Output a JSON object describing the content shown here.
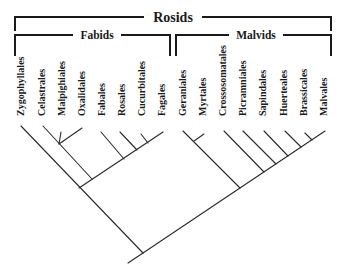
{
  "diagram": {
    "type": "phylogenetic-cladogram",
    "title": "Rosids",
    "clades": [
      {
        "name": "Fabids",
        "orders": [
          "Zygophyllales",
          "Celastrales",
          "Malpighiales",
          "Oxalidales",
          "Fabales",
          "Rosales",
          "Cucurbitales",
          "Fagales"
        ]
      },
      {
        "name": "Malvids",
        "orders": [
          "Geraniales",
          "Myrtales",
          "Crossosomatales",
          "Picramniales",
          "Sapindales",
          "Huerteales",
          "Brassicales",
          "Malvales"
        ]
      }
    ],
    "tips": [
      {
        "label": "Zygophyllales",
        "x": 20
      },
      {
        "label": "Celastrales",
        "x": 41
      },
      {
        "label": "Malpighiales",
        "x": 61
      },
      {
        "label": "Oxalidales",
        "x": 81
      },
      {
        "label": "Fabales",
        "x": 101
      },
      {
        "label": "Rosales",
        "x": 121
      },
      {
        "label": "Cucurbitales",
        "x": 141
      },
      {
        "label": "Fagales",
        "x": 161
      },
      {
        "label": "Geraniales",
        "x": 182
      },
      {
        "label": "Myrtales",
        "x": 202
      },
      {
        "label": "Crossosomatales",
        "x": 222
      },
      {
        "label": "Picramniales",
        "x": 242
      },
      {
        "label": "Sapindales",
        "x": 262
      },
      {
        "label": "Huerteales",
        "x": 283
      },
      {
        "label": "Brassicales",
        "x": 303
      },
      {
        "label": "Malvales",
        "x": 323
      }
    ],
    "colors": {
      "line": "#2a2a2a",
      "text": "#1a1a1a",
      "background": "#ffffff"
    }
  }
}
